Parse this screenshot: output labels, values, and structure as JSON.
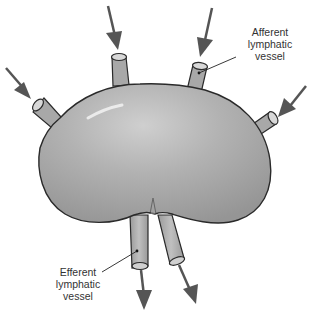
{
  "diagram": {
    "labels": {
      "afferent": {
        "line1": "Afferent",
        "line2": "lymphatic",
        "line3": "vessel"
      },
      "efferent": {
        "line1": "Efferent",
        "line2": "lymphatic",
        "line3": "vessel"
      }
    },
    "colors": {
      "node_fill": "#a9a9a9",
      "node_highlight": "#d6d6d6",
      "outline": "#2a2a2a",
      "arrow": "#555555",
      "text": "#333333"
    }
  }
}
